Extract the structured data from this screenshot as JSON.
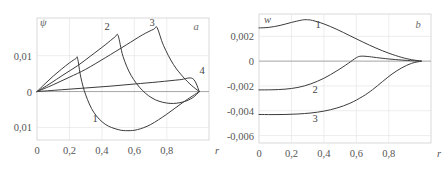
{
  "figure": {
    "background": "#ffffff",
    "curve_color": "#3b3b3b",
    "grid_color": "#e0e0e0",
    "axis_color": "#8a8a8a"
  },
  "chart_data": [
    {
      "type": "line",
      "panel_label": "a",
      "title": "",
      "xlabel": "r",
      "ylabel": "ψ",
      "xlim": [
        0,
        1.06
      ],
      "ylim": [
        -0.0135,
        0.0205
      ],
      "grid": true,
      "legend": "inline curve numbers",
      "xticks": [
        0,
        0.2,
        0.4,
        0.6,
        0.8
      ],
      "xticklabels": [
        "0",
        "0,2",
        "0,4",
        "0,6",
        "0,8"
      ],
      "yticks": [
        0.01,
        0,
        -0.01
      ],
      "yticklabels": [
        "0,01",
        "0",
        "0,01"
      ],
      "series": [
        {
          "name": "1",
          "label": "1",
          "x": [
            0.0,
            0.05,
            0.1,
            0.15,
            0.2,
            0.24,
            0.25,
            0.27,
            0.3,
            0.35,
            0.42,
            0.5,
            0.56,
            0.62,
            0.7,
            0.8,
            0.9,
            1.0
          ],
          "values": [
            0.0,
            0.0022,
            0.0043,
            0.0062,
            0.008,
            0.0092,
            0.0093,
            0.004,
            -0.0009,
            -0.0058,
            -0.0091,
            -0.0106,
            -0.0109,
            -0.0106,
            -0.0092,
            -0.0063,
            -0.003,
            0.0
          ]
        },
        {
          "name": "2",
          "label": "2",
          "x": [
            0.0,
            0.08,
            0.16,
            0.25,
            0.33,
            0.42,
            0.48,
            0.5,
            0.53,
            0.58,
            0.65,
            0.73,
            0.82,
            0.9,
            0.96,
            1.0
          ],
          "values": [
            0.0,
            0.0022,
            0.0046,
            0.0072,
            0.0099,
            0.013,
            0.0152,
            0.0156,
            0.0098,
            0.0045,
            0.0003,
            -0.0023,
            -0.0033,
            -0.0029,
            -0.0017,
            0.0
          ]
        },
        {
          "name": "3",
          "label": "3",
          "x": [
            0.0,
            0.1,
            0.2,
            0.3,
            0.42,
            0.55,
            0.65,
            0.72,
            0.74,
            0.78,
            0.84,
            0.9,
            0.95,
            1.0
          ],
          "values": [
            0.0,
            0.0019,
            0.004,
            0.0062,
            0.0094,
            0.013,
            0.0158,
            0.0174,
            0.0178,
            0.0128,
            0.0076,
            0.0041,
            0.0018,
            0.0
          ]
        },
        {
          "name": "4",
          "label": "4",
          "x": [
            0.0,
            0.15,
            0.3,
            0.45,
            0.6,
            0.75,
            0.88,
            0.96,
            1.0
          ],
          "values": [
            0.0,
            0.0005,
            0.001,
            0.0015,
            0.0021,
            0.0027,
            0.0033,
            0.0036,
            0.0
          ]
        }
      ]
    },
    {
      "type": "line",
      "panel_label": "b",
      "title": "",
      "xlabel": "r",
      "ylabel": "w",
      "xlim": [
        0,
        1.06
      ],
      "ylim": [
        -0.0066,
        0.0038
      ],
      "grid": true,
      "legend": "inline curve numbers",
      "xticks": [
        0,
        0.2,
        0.4,
        0.6,
        0.8
      ],
      "xticklabels": [
        "0",
        "0,2",
        "0,4",
        "0,6",
        "0,8"
      ],
      "yticks": [
        0.002,
        0,
        -0.002,
        -0.004,
        -0.006
      ],
      "yticklabels": [
        "0,002",
        "0",
        "-0,002",
        "-0,004",
        "-0,006"
      ],
      "series": [
        {
          "name": "1",
          "label": "1",
          "x": [
            0.0,
            0.06,
            0.13,
            0.2,
            0.26,
            0.29,
            0.33,
            0.4,
            0.48,
            0.56,
            0.64,
            0.72,
            0.8,
            0.88,
            0.94,
            1.0
          ],
          "values": [
            0.00268,
            0.00272,
            0.00288,
            0.00312,
            0.0033,
            0.00334,
            0.00328,
            0.003,
            0.00256,
            0.00205,
            0.00154,
            0.00106,
            0.00064,
            0.0003,
            0.00012,
            0.0
          ]
        },
        {
          "name": "2",
          "label": "2",
          "x": [
            0.0,
            0.08,
            0.16,
            0.24,
            0.32,
            0.4,
            0.48,
            0.55,
            0.6,
            0.63,
            0.68,
            0.74,
            0.82,
            0.9,
            0.96,
            1.0
          ],
          "values": [
            -0.00232,
            -0.00231,
            -0.00226,
            -0.00212,
            -0.00183,
            -0.00138,
            -0.00078,
            -0.00018,
            0.00028,
            0.0004,
            0.00036,
            0.00026,
            0.00015,
            7e-05,
            2e-05,
            0.0
          ]
        },
        {
          "name": "3",
          "label": "3",
          "x": [
            0.0,
            0.08,
            0.16,
            0.24,
            0.32,
            0.4,
            0.48,
            0.56,
            0.64,
            0.7,
            0.76,
            0.82,
            0.88,
            0.94,
            1.0
          ],
          "values": [
            -0.0043,
            -0.00431,
            -0.0043,
            -0.00426,
            -0.00418,
            -0.00403,
            -0.00378,
            -0.0034,
            -0.00284,
            -0.0023,
            -0.00166,
            -0.00104,
            -0.00054,
            -0.00018,
            0.0
          ]
        }
      ]
    }
  ]
}
